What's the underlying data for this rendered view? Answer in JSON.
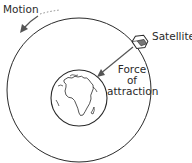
{
  "diagram": {
    "labels": {
      "motion": "Motion",
      "satellite": "Satellite",
      "force_line1": "Force",
      "force_line2": "of",
      "force_line3": "attraction"
    },
    "elements": {
      "orbit": "orbit-circle",
      "planet": "earth",
      "satellite": "satellite-icon",
      "force_arrow": "arrow toward earth",
      "motion_arrow": "arrow along orbit (counter-clockwise)"
    },
    "colors": {
      "stroke": "#2a2a2a",
      "background": "#ffffff"
    }
  }
}
